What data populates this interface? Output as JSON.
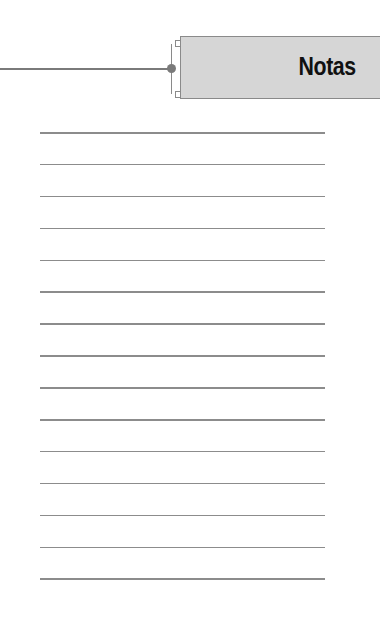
{
  "header": {
    "title": "Notas"
  },
  "notes": {
    "line_count": 15
  },
  "colors": {
    "header_bg": "#d6d6d6",
    "line": "#8c8c8c",
    "connector": "#7a7a7a"
  }
}
